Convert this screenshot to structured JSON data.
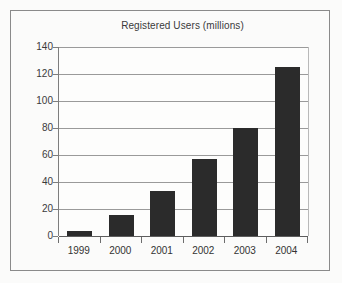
{
  "chart_data": {
    "type": "bar",
    "title": "Registered Users (millions)",
    "xlabel": "",
    "ylabel": "",
    "categories": [
      "1999",
      "2000",
      "2001",
      "2002",
      "2003",
      "2004"
    ],
    "values": [
      4,
      15.5,
      33,
      57,
      80,
      125
    ],
    "ylim": [
      0,
      140
    ],
    "yticks": [
      0,
      20,
      40,
      60,
      80,
      100,
      120,
      140
    ],
    "ytick_labels": [
      "0",
      "20",
      "40",
      "60",
      "80",
      "100",
      "120",
      "140"
    ],
    "grid": true,
    "legend": null,
    "bar_color": "#2b2b2b",
    "gridline_color": "#9a9a9a",
    "background_color": "#fbfbfa",
    "frame_color": "#8a8a8a"
  }
}
